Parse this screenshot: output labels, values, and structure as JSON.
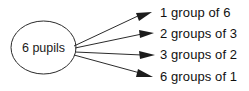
{
  "diagram": {
    "type": "factor-tree",
    "source_node": {
      "label": "6 pupils",
      "shape": "ellipse"
    },
    "branches": [
      {
        "label": "1 group of 6",
        "groups": 1,
        "size": 6
      },
      {
        "label": "2 groups of 3",
        "groups": 2,
        "size": 3
      },
      {
        "label": "3 groups of 2",
        "groups": 3,
        "size": 2
      },
      {
        "label": "6 groups of 1",
        "groups": 6,
        "size": 1
      }
    ],
    "colors": {
      "background": "#ffffff",
      "stroke": "#2b2b2b",
      "text": "#111111"
    }
  }
}
